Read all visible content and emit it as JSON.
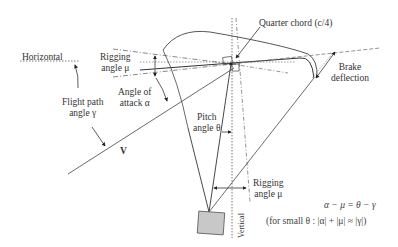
{
  "diagram": {
    "labels": {
      "horizontal": "Horizontal",
      "rigging_angle_top_line1": "Rigging",
      "rigging_angle_top_line2": "angle μ",
      "angle_of_attack_line1": "Angle of",
      "angle_of_attack_line2": "attack α",
      "flight_path_line1": "Flight path",
      "flight_path_line2": "angle γ",
      "velocity": "V",
      "quarter_chord": "Quarter chord (c/4)",
      "brake_line1": "Brake",
      "brake_line2": "deflection",
      "pitch_line1": "Pitch",
      "pitch_line2": "angle θ",
      "rigging_angle_bottom_line1": "Rigging",
      "rigging_angle_bottom_line2": "angle μ",
      "vertical": "Vertical"
    },
    "equations": {
      "main": "α − μ = θ − γ",
      "small_theta": "(for small θ : |α| + |μ| ≈ |γ|)"
    },
    "colors": {
      "line": "#444444",
      "payload_fill": "#c8c8c8",
      "background": "#ffffff"
    }
  }
}
